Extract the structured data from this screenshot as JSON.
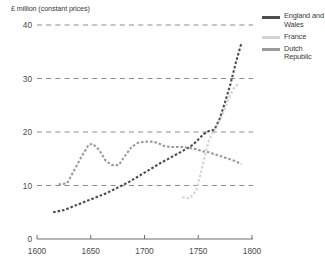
{
  "chart_data": {
    "type": "line",
    "title": "",
    "ylabel": "£ million (constant prices)",
    "xlabel": "",
    "xlim": [
      1600,
      1800
    ],
    "ylim": [
      0,
      40
    ],
    "xticks": [
      1600,
      1650,
      1700,
      1750,
      1800
    ],
    "yticks": [
      0,
      10,
      20,
      30,
      40
    ],
    "grid": "horizontal-dashed",
    "legend_position": "right",
    "line_style": "dotted",
    "series": [
      {
        "name": "England and Wales",
        "color": "#4d4d4d",
        "x": [
          1615,
          1625,
          1635,
          1645,
          1655,
          1665,
          1675,
          1685,
          1695,
          1705,
          1715,
          1725,
          1735,
          1745,
          1755,
          1760,
          1765,
          1770,
          1775,
          1780,
          1785,
          1790
        ],
        "values": [
          5.0,
          5.4,
          6.2,
          7.0,
          7.8,
          8.6,
          9.6,
          10.6,
          11.8,
          13.0,
          14.2,
          15.3,
          16.4,
          17.6,
          19.6,
          20.2,
          20.4,
          22.5,
          25.6,
          29.0,
          33.0,
          36.5
        ]
      },
      {
        "name": "France",
        "color": "#d4d4d4",
        "x": [
          1735,
          1742,
          1748,
          1752,
          1756,
          1760,
          1764,
          1768,
          1772,
          1776,
          1780,
          1784,
          1788
        ],
        "values": [
          7.8,
          7.6,
          9.0,
          12.0,
          15.5,
          18.5,
          20.0,
          21.5,
          23.0,
          25.0,
          27.0,
          28.5,
          29.0
        ]
      },
      {
        "name": "Dutch Republic",
        "color": "#9b9b9b",
        "x": [
          1620,
          1628,
          1635,
          1642,
          1648,
          1652,
          1658,
          1664,
          1670,
          1676,
          1682,
          1688,
          1694,
          1700,
          1706,
          1712,
          1718,
          1724,
          1730,
          1736,
          1742,
          1748,
          1754,
          1760,
          1766,
          1772,
          1778,
          1784,
          1790
        ],
        "values": [
          10.2,
          10.4,
          13.0,
          15.6,
          17.6,
          17.8,
          16.6,
          14.6,
          13.8,
          13.8,
          15.6,
          17.2,
          18.0,
          18.2,
          18.2,
          18.0,
          17.4,
          17.2,
          17.2,
          17.2,
          17.0,
          16.8,
          16.4,
          16.2,
          15.8,
          15.4,
          15.0,
          14.6,
          14.0
        ]
      }
    ]
  },
  "legend": {
    "items": [
      {
        "label": "England and Wales",
        "color": "#4d4d4d"
      },
      {
        "label": "France",
        "color": "#d4d4d4"
      },
      {
        "label": "Dutch Republic",
        "color": "#9b9b9b"
      }
    ]
  },
  "colors": {
    "axis": "#6e6e6e",
    "grid": "#8c8c8c",
    "text": "#3a3a3a"
  }
}
